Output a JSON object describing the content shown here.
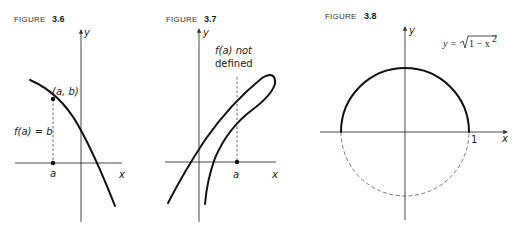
{
  "figures": [
    {
      "caption_word": "FIGURE",
      "caption_number": "3.6",
      "x_axis_label": "x",
      "y_axis_label": "y",
      "point_label": "(a, b)",
      "dashed_label": "f(a) = b",
      "tick_label": "a"
    },
    {
      "caption_word": "FIGURE",
      "caption_number": "3.7",
      "x_axis_label": "x",
      "y_axis_label": "y",
      "note_line1": "f(a) not",
      "note_line2": "defined",
      "tick_label": "a"
    },
    {
      "caption_word": "FIGURE",
      "caption_number": "3.8",
      "x_axis_label": "x",
      "y_axis_label": "y",
      "equation_lhs": "y =",
      "equation_radicand": "1 − x",
      "equation_exponent": "2",
      "tick_label": "1"
    }
  ]
}
